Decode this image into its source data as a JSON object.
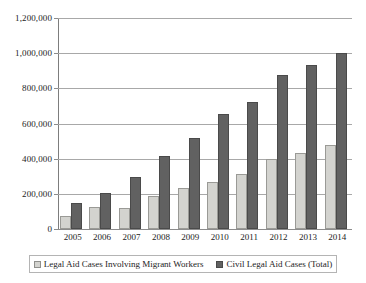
{
  "chart_data": {
    "type": "bar",
    "title": "",
    "subtitle": "",
    "xlabel": "",
    "ylabel": "",
    "ylim": [
      0,
      1200000
    ],
    "ytick_interval": 200000,
    "ytick_labels": [
      "1,200,000",
      "1,000,000",
      "800,000",
      "600,000",
      "400,000",
      "200,000",
      "0"
    ],
    "ytick_values": [
      1200000,
      1000000,
      800000,
      600000,
      400000,
      200000,
      0
    ],
    "grid": true,
    "grid_axis": "y",
    "legend_position": "bottom",
    "categories": [
      "2005",
      "2006",
      "2007",
      "2008",
      "2009",
      "2010",
      "2011",
      "2012",
      "2013",
      "2014"
    ],
    "series": [
      {
        "name": "Legal Aid Cases Involving Migrant Workers",
        "color": "#d3d3cf",
        "values": [
          75000,
          128000,
          120000,
          190000,
          235000,
          268000,
          313000,
          400000,
          430000,
          475000
        ]
      },
      {
        "name": "Civil Legal Aid Cases (Total)",
        "color": "#616161",
        "values": [
          148000,
          205000,
          297000,
          415000,
          517000,
          655000,
          725000,
          875000,
          930000,
          1000000
        ]
      }
    ]
  },
  "legend": {
    "items": [
      {
        "label": "Legal Aid Cases Involving Migrant Workers",
        "swatch": "series-a-swatch"
      },
      {
        "label": "Civil Legal Aid Cases (Total)",
        "swatch": "series-b-swatch"
      }
    ]
  }
}
